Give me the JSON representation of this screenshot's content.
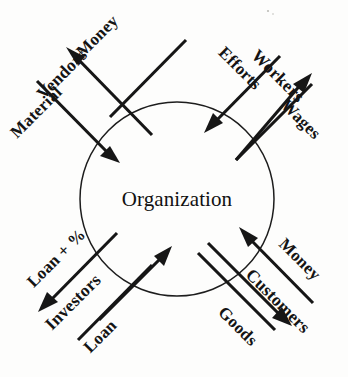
{
  "diagram": {
    "title": "Organization",
    "center": {
      "label": "Organization",
      "shape": "circle"
    },
    "line_color": "#161616",
    "text_color": "#141414",
    "background_color": "#fdfdfc",
    "stakeholders": [
      {
        "id": "vendors",
        "label": "Vendors",
        "quadrant": "top-left",
        "flows": [
          {
            "id": "vendors-money",
            "label": "Money",
            "direction": "outbound",
            "from": "Organization",
            "to": "Vendors"
          },
          {
            "id": "vendors-material",
            "label": "Material",
            "direction": "inbound",
            "from": "Vendors",
            "to": "Organization"
          }
        ]
      },
      {
        "id": "workers",
        "label": "Workers",
        "quadrant": "top-right",
        "flows": [
          {
            "id": "workers-efforts",
            "label": "Efforts",
            "direction": "inbound",
            "from": "Workers",
            "to": "Organization"
          },
          {
            "id": "workers-wages",
            "label": "Wages",
            "direction": "outbound",
            "from": "Organization",
            "to": "Workers"
          }
        ]
      },
      {
        "id": "investors",
        "label": "Investors",
        "quadrant": "bottom-left",
        "flows": [
          {
            "id": "investors-loan-interest",
            "label": "Loan + %",
            "direction": "outbound",
            "from": "Organization",
            "to": "Investors"
          },
          {
            "id": "investors-loan",
            "label": "Loan",
            "direction": "inbound",
            "from": "Investors",
            "to": "Organization"
          }
        ]
      },
      {
        "id": "customers",
        "label": "Customers",
        "quadrant": "bottom-right",
        "flows": [
          {
            "id": "customers-money",
            "label": "Money",
            "direction": "inbound",
            "from": "Customers",
            "to": "Organization"
          },
          {
            "id": "customers-goods",
            "label": "Goods",
            "direction": "outbound",
            "from": "Organization",
            "to": "Customers"
          }
        ]
      }
    ]
  }
}
